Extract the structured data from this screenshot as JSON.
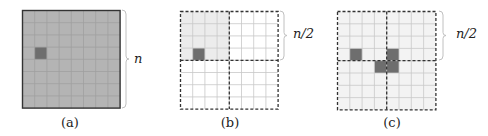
{
  "panels": [
    {
      "id": "a",
      "caption": "(a)",
      "brace_label": "n",
      "grid_size": 8,
      "style": "solid-gray",
      "dark_cells": [
        [
          3,
          1
        ]
      ],
      "shaded_region": "all"
    },
    {
      "id": "b",
      "caption": "(b)",
      "brace_label": "n/2",
      "grid_size": 8,
      "style": "dashed-quadrants",
      "dark_cells": [
        [
          3,
          1
        ]
      ],
      "shaded_region": "top-left-quadrant"
    },
    {
      "id": "c",
      "caption": "(c)",
      "brace_label": "n/2",
      "grid_size": 8,
      "style": "dashed-quadrants",
      "dark_cells": [
        [
          3,
          1
        ],
        [
          3,
          4
        ],
        [
          4,
          3
        ],
        [
          4,
          4
        ]
      ],
      "shaded_region": "all-light"
    }
  ],
  "colors": {
    "grid_fill_a": "#b4b4b4",
    "grid_line_a": "#a0a0a0",
    "border": "#333333",
    "dark_cell": "#6e6e6e",
    "light_fill": "#ececec",
    "very_light_fill": "#f3f3f3",
    "grid_line_light": "#c8c8c8",
    "brace": "#c0c0c0"
  }
}
